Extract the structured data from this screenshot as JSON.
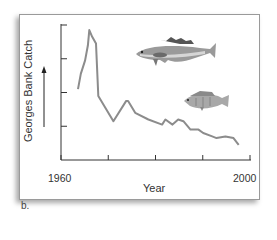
{
  "figure": {
    "caption": "b.",
    "illustrations": [
      "cod-fish-illustration",
      "perch-fish-illustration"
    ]
  },
  "chart_data": {
    "type": "line",
    "title": "",
    "xlabel": "Year",
    "ylabel": "Georges Bank Catch",
    "y_arrow": "up (increasing catch)",
    "x_tick_labels": [
      "1960",
      "",
      "",
      "",
      "2000"
    ],
    "x_ticks": [
      1960,
      1970,
      1980,
      1990,
      2000
    ],
    "y_ticks_unlabeled": [
      1,
      2,
      3,
      4
    ],
    "xlim": [
      1960,
      2000
    ],
    "ylim": [
      0,
      4
    ],
    "grid": false,
    "legend": null,
    "series": [
      {
        "name": "Georges Bank Catch",
        "color": "#8c8c8c",
        "x": [
          1963.6,
          1964.2,
          1965.1,
          1965.7,
          1966.0,
          1966.6,
          1967.4,
          1967.9,
          1971.1,
          1973.8,
          1974.2,
          1975.7,
          1978.5,
          1981.4,
          1982.1,
          1983.6,
          1984.8,
          1985.9,
          1987.4,
          1989.1,
          1990.1,
          1992.0,
          1992.9,
          1994.8,
          1996.5,
          1997.6
        ],
        "values": [
          2.1,
          2.55,
          2.95,
          3.4,
          3.85,
          3.65,
          3.45,
          1.9,
          1.15,
          1.75,
          1.75,
          1.4,
          1.2,
          1.05,
          1.2,
          1.05,
          1.2,
          1.15,
          0.9,
          0.9,
          0.8,
          0.7,
          0.65,
          0.7,
          0.65,
          0.45
        ]
      }
    ]
  }
}
